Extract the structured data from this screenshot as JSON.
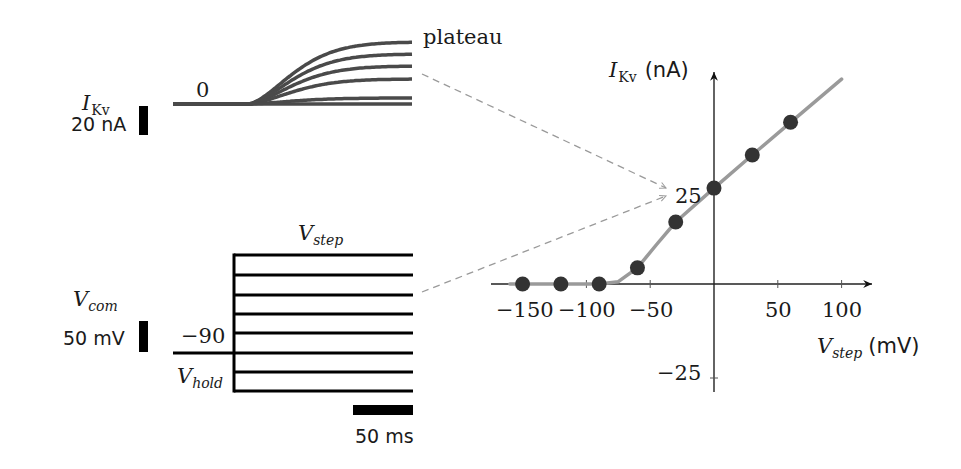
{
  "figure": {
    "background": "#ffffff",
    "current_panel": {
      "y_label_main": "I",
      "y_label_sub": "Kv",
      "zero_label": "0",
      "plateau_label": "plateau",
      "scale_bar_label": "20 nA",
      "trace_color": "#4a4a4a",
      "x_start": 173,
      "x_onset": 248,
      "x_end": 413,
      "baseline_y": 104,
      "plateau_y": [
        42,
        54,
        66,
        79,
        98,
        104
      ]
    },
    "voltage_panel": {
      "command_label_main": "V",
      "command_label_sub": "com",
      "step_label_main": "V",
      "step_label_sub": "step",
      "hold_label_main": "V",
      "hold_label_sub": "hold",
      "hold_value_label": "−90",
      "scale_bar_mv_label": "50 mV",
      "scale_bar_ms_label": "50 ms",
      "line_color": "#000000",
      "hold_x_start": 173,
      "step_x": 234,
      "x_end": 413,
      "hold_y": 353,
      "step_y": [
        255,
        275,
        295,
        314,
        333,
        353,
        372,
        391
      ]
    },
    "connectors": {
      "color": "#9a9a9a",
      "lines": [
        {
          "from": [
            422,
            74
          ],
          "to": [
            666,
            188
          ]
        },
        {
          "from": [
            422,
            292
          ],
          "to": [
            666,
            196
          ]
        }
      ]
    },
    "iv_plot": {
      "y_axis_label_main": "I",
      "y_axis_label_sub": "Kv",
      "y_axis_unit": "(nA)",
      "x_axis_label_main": "V",
      "x_axis_label_sub": "step",
      "x_axis_unit": "(mV)",
      "x_tick_labels": [
        "−150",
        "−100",
        "−50",
        "50",
        "100"
      ],
      "y_tick_labels": [
        "25",
        "−25"
      ],
      "fit_color": "#9a9a9a",
      "point_color": "#333333"
    }
  },
  "chart_data": {
    "type": "scatter",
    "title": "",
    "xlabel": "V_step (mV)",
    "ylabel": "I_Kv (nA)",
    "x_ticks": [
      -150,
      -100,
      -50,
      50,
      100
    ],
    "y_ticks": [
      25,
      -25
    ],
    "xlim": [
      -170,
      125
    ],
    "ylim": [
      -28,
      57
    ],
    "series": [
      {
        "name": "measured plateau current",
        "x": [
          -150,
          -120,
          -90,
          -60,
          -30,
          0,
          30,
          60
        ],
        "y": [
          0,
          0,
          0,
          4.3,
          16.5,
          25.5,
          34.3,
          43
        ]
      },
      {
        "name": "fit",
        "type": "line",
        "x": [
          -160,
          -90,
          -75,
          -60,
          -45,
          -30,
          0,
          30,
          60,
          100
        ],
        "y": [
          0,
          0,
          0.6,
          4.3,
          10.5,
          16.5,
          25.5,
          34.3,
          43,
          54.5
        ]
      }
    ],
    "grid": false,
    "legend": "none"
  }
}
